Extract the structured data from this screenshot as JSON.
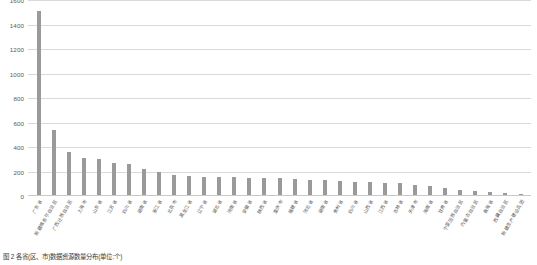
{
  "chart_data": {
    "type": "bar",
    "title": "",
    "xlabel": "",
    "ylabel": "",
    "ylim": [
      0,
      1600
    ],
    "ytick_step": 200,
    "grid": true,
    "legend": "none",
    "bar_color": "#9a9a9a",
    "gridline_color": "#d9d9d9",
    "yticks": [
      "0",
      "200",
      "400",
      "600",
      "800",
      "1000",
      "1200",
      "1400",
      "1600"
    ],
    "categories": [
      "广东省",
      "新疆维吾尔自治区",
      "广西壮族自治区",
      "上海市",
      "山东省",
      "江苏省",
      "四川省",
      "湖南省",
      "浙江省",
      "北京市",
      "黑龙江省",
      "辽宁省",
      "湖北省",
      "河南省",
      "安徽省",
      "陕西省",
      "重庆市",
      "福建省",
      "河北省",
      "湖南省",
      "贵州省",
      "四川省",
      "山西省",
      "江西省",
      "吉林省",
      "天津市",
      "海南省",
      "甘肃省",
      "宁夏回族自治区",
      "内蒙古自治区",
      "青海省",
      "西藏自治区",
      "新疆生产建设兵团"
    ],
    "values": [
      1500,
      530,
      355,
      300,
      290,
      265,
      250,
      215,
      185,
      160,
      155,
      150,
      150,
      145,
      140,
      140,
      135,
      130,
      125,
      120,
      115,
      110,
      105,
      100,
      95,
      85,
      75,
      60,
      45,
      35,
      25,
      18,
      10
    ]
  },
  "caption": {
    "text": "图 2  各省(区、市)数据资源数量分布(单位:个)"
  }
}
